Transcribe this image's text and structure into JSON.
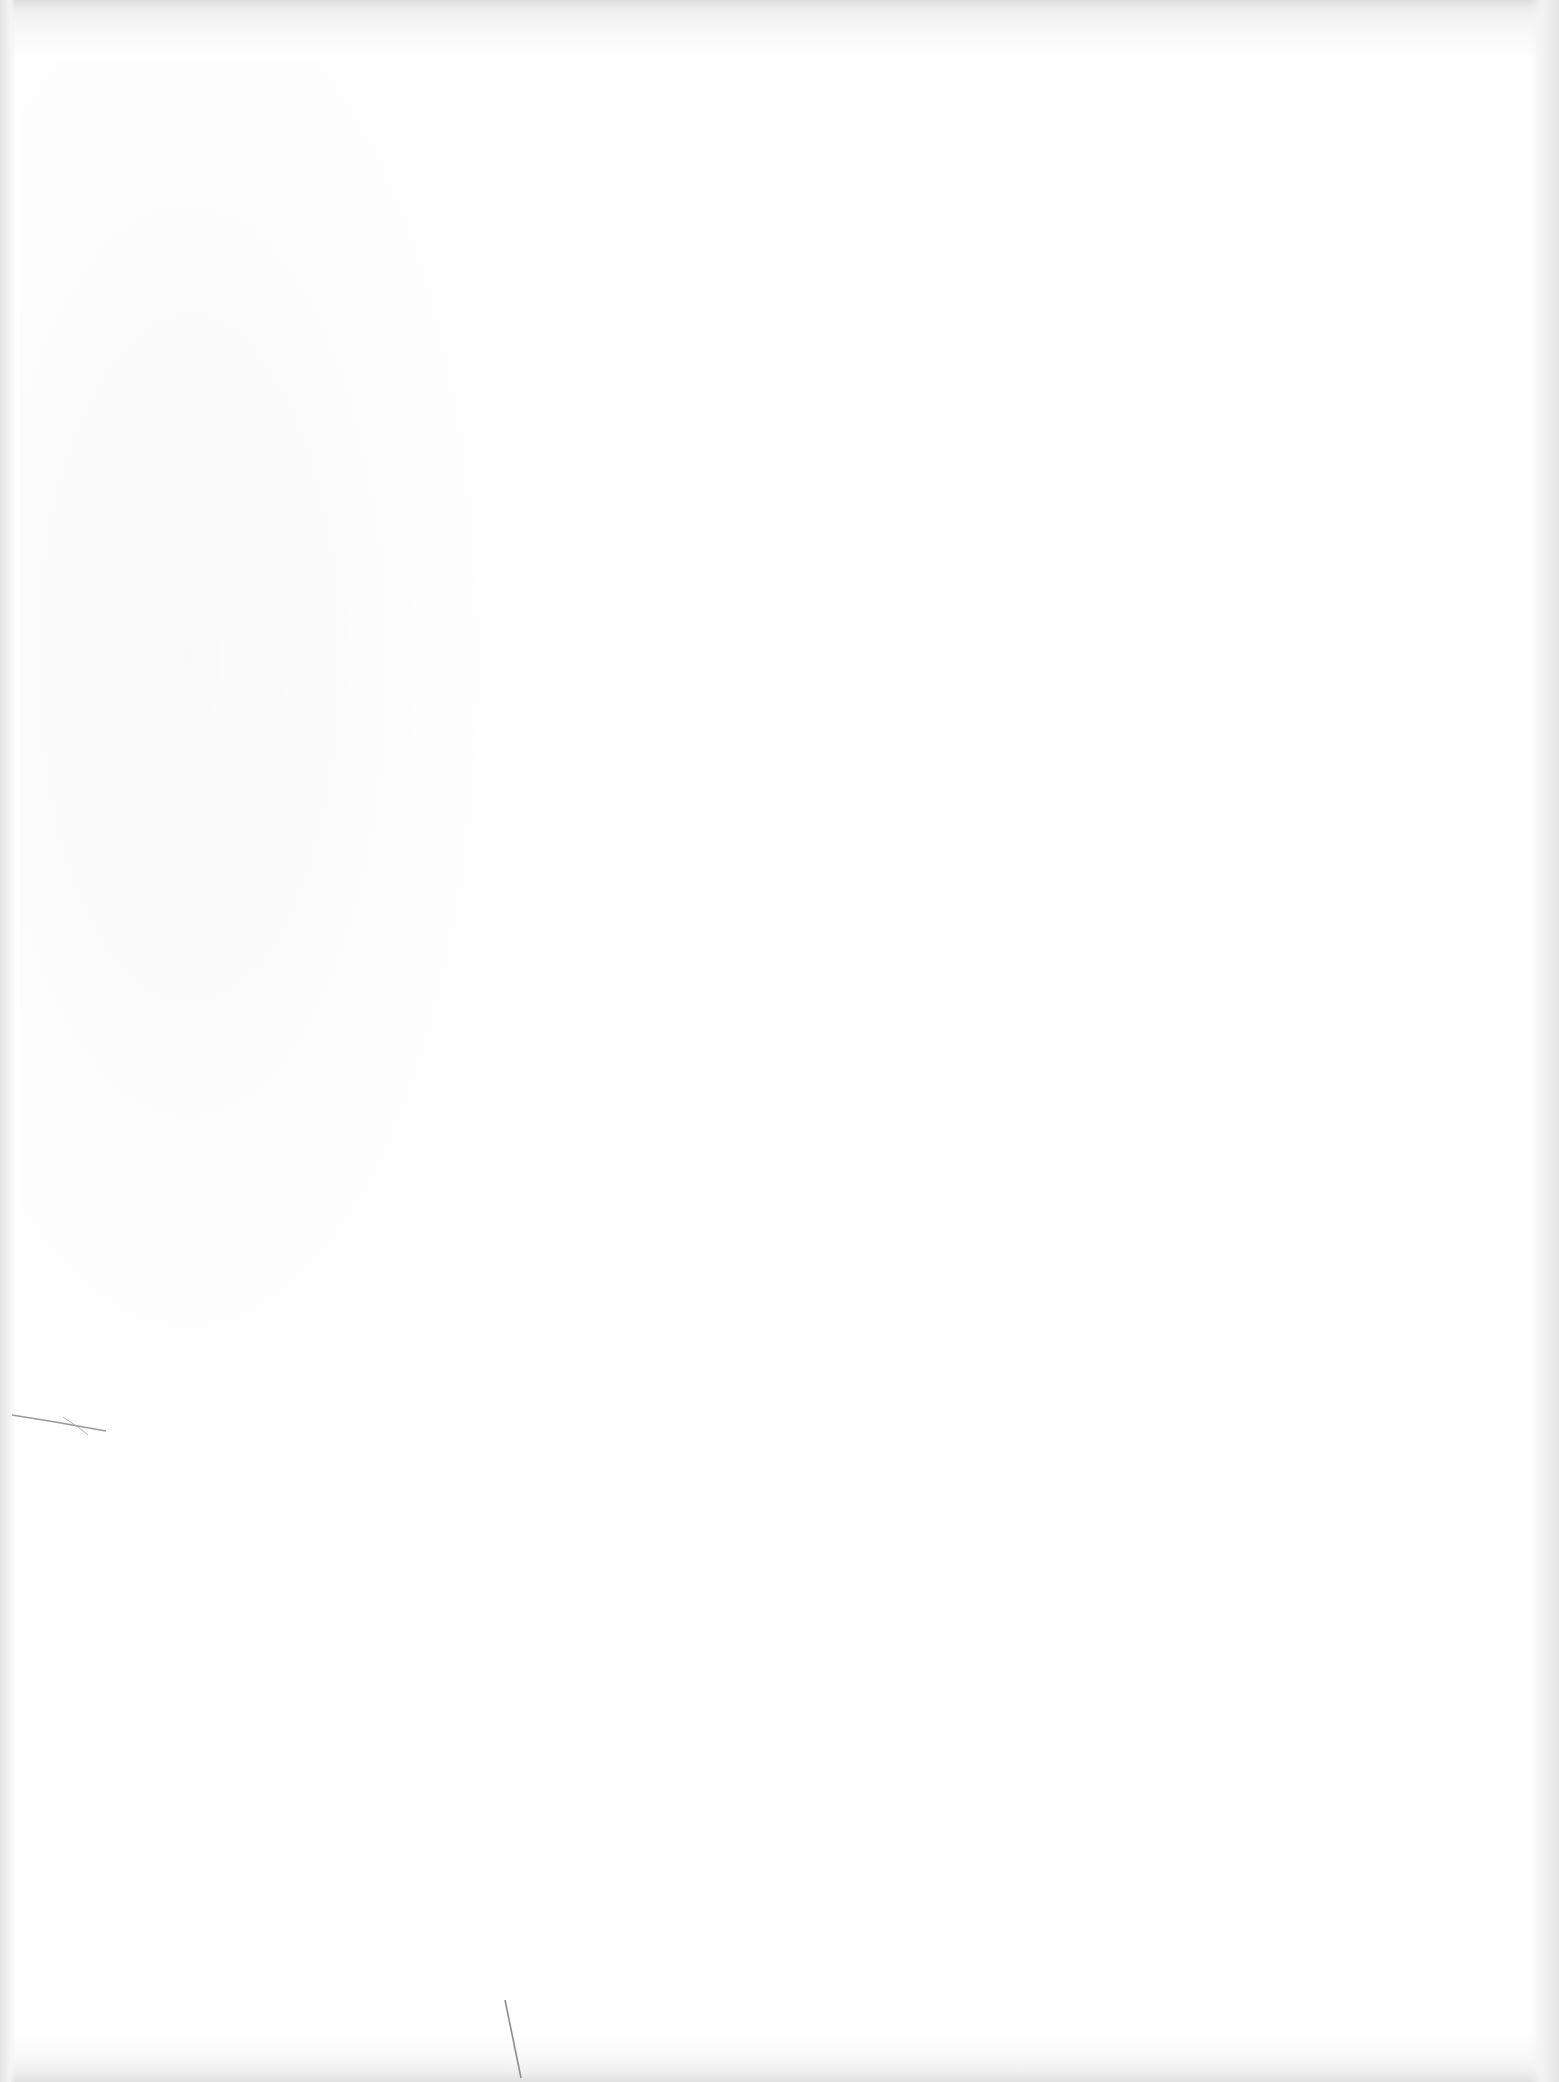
{
  "document": {
    "type": "blank scanned page",
    "text_content": "",
    "background_color": "#ffffff",
    "edge_shade_color": "#e2e2e2"
  }
}
